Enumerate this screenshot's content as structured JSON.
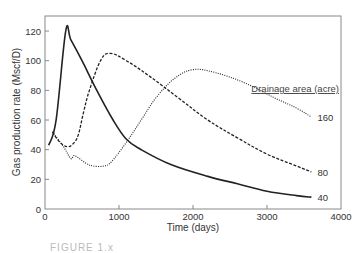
{
  "chart_data": {
    "type": "line",
    "title": "",
    "xlabel": "Time (days)",
    "ylabel": "Gas production rate (Mscf/D)",
    "xlim": [
      0,
      4000
    ],
    "ylim": [
      0,
      130
    ],
    "xticks": [
      0,
      1000,
      2000,
      3000,
      4000
    ],
    "yticks": [
      0,
      20,
      40,
      60,
      80,
      100,
      120
    ],
    "grid": false,
    "legend_title": "Drainage area (acre)",
    "series": [
      {
        "name": "40",
        "style": "solid",
        "x": [
          50,
          150,
          280,
          350,
          500,
          700,
          920,
          1100,
          1300,
          1700,
          2200,
          2600,
          3000,
          3400,
          3600
        ],
        "values": [
          43,
          60,
          120,
          114,
          100,
          80,
          60,
          47,
          40,
          30,
          22,
          17,
          12,
          9,
          8
        ]
      },
      {
        "name": "80",
        "style": "dashed",
        "x": [
          100,
          200,
          300,
          380,
          450,
          520,
          600,
          750,
          880,
          1100,
          1400,
          1800,
          2200,
          2600,
          3000,
          3400,
          3600
        ],
        "values": [
          52,
          45,
          42,
          44,
          50,
          65,
          80,
          100,
          105,
          100,
          90,
          75,
          60,
          48,
          37,
          29,
          25
        ]
      },
      {
        "name": "160",
        "style": "dotted",
        "x": [
          100,
          250,
          350,
          400,
          550,
          650,
          800,
          900,
          1100,
          1300,
          1500,
          1750,
          2000,
          2300,
          2700,
          3100,
          3400,
          3600
        ],
        "values": [
          52,
          42,
          34,
          36,
          31,
          29,
          29,
          32,
          45,
          60,
          75,
          88,
          94,
          92,
          85,
          75,
          68,
          62
        ]
      }
    ]
  },
  "caption": "FIGURE 1.x"
}
